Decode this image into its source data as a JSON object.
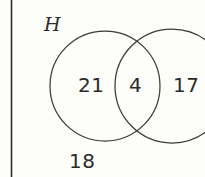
{
  "figure": {
    "kind": "venn-diagram-two-set",
    "width": 205,
    "height": 177,
    "background_color": "#fdfdfa",
    "stroke_color": "#3b3b3b",
    "text_color": "#2b2b2b"
  },
  "labels": {
    "universe": "H",
    "left_only": "21",
    "overlap": "4",
    "right_only": "17",
    "outside": "18"
  },
  "regions": [
    {
      "name": "left-only",
      "value": "21"
    },
    {
      "name": "intersection",
      "value": "4"
    },
    {
      "name": "right-only",
      "value": "17"
    },
    {
      "name": "outside",
      "value": "18"
    }
  ],
  "geometry": {
    "left_circle": {
      "cx": 105,
      "cy": 86,
      "r": 55
    },
    "right_circle": {
      "cx": 172,
      "cy": 86,
      "r": 57
    },
    "margin_rule": {
      "x": 11,
      "y1": 0,
      "y2": 177
    }
  }
}
